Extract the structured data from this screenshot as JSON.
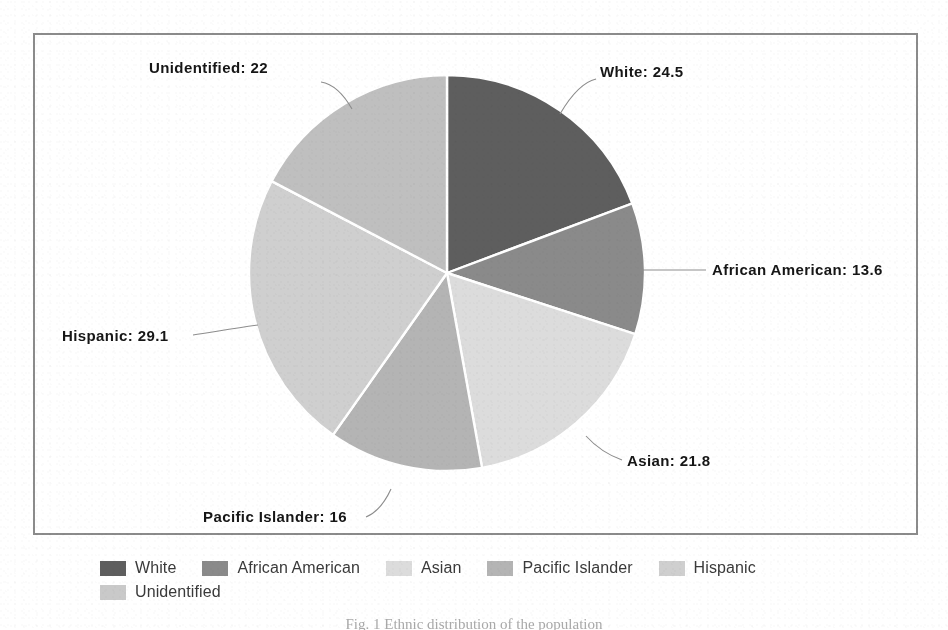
{
  "chart_data": {
    "type": "pie",
    "title": "",
    "categories": [
      "White",
      "African American",
      "Asian",
      "Pacific Islander",
      "Hispanic",
      "Unidentified"
    ],
    "values": [
      24.5,
      13.6,
      21.8,
      16,
      29.1,
      22
    ],
    "total": 127.0,
    "start_angle_deg": 0,
    "direction": "clockwise",
    "labels": [
      "White: 24.5",
      "African American: 13.6",
      "Asian: 21.8",
      "Pacific Islander: 16",
      "Hispanic: 29.1",
      "Unidentified: 22"
    ],
    "slice_colors": [
      "#5e5e5e",
      "#8a8a8a",
      "#dcdcdc",
      "#b4b4b4",
      "#cfcfcf",
      "#bfbfbf"
    ],
    "legend_position": "bottom",
    "grid": false
  },
  "frame": {
    "border_color": "#8b8b8b"
  },
  "pie": {
    "center_x": 447,
    "center_y": 273,
    "radius": 198,
    "separator_color": "#ffffff",
    "slices": [
      {
        "name": "White",
        "label": "White: 24.5",
        "value": 24.5,
        "color": "#5e5e5e"
      },
      {
        "name": "African American",
        "label": "African American: 13.6",
        "value": 13.6,
        "color": "#8a8a8a"
      },
      {
        "name": "Asian",
        "label": "Asian: 21.8",
        "value": 21.8,
        "color": "#dcdcdc"
      },
      {
        "name": "Pacific Islander",
        "label": "Pacific Islander: 16",
        "value": 16,
        "color": "#b4b4b4"
      },
      {
        "name": "Hispanic",
        "label": "Hispanic: 29.1",
        "value": 29.1,
        "color": "#cfcfcf"
      },
      {
        "name": "Unidentified",
        "label": "Unidentified: 22",
        "value": 22,
        "color": "#bfbfbf"
      }
    ]
  },
  "legend": {
    "rows": [
      [
        {
          "label": "White",
          "color": "#5e5e5e"
        },
        {
          "label": "African American",
          "color": "#8a8a8a"
        },
        {
          "label": "Asian",
          "color": "#dcdcdc"
        },
        {
          "label": "Pacific Islander",
          "color": "#b4b4b4"
        },
        {
          "label": "Hispanic",
          "color": "#cfcfcf"
        }
      ],
      [
        {
          "label": "Unidentified",
          "color": "#c9c9c9"
        }
      ]
    ]
  },
  "caption": {
    "text": "Fig. 1   Ethnic distribution of the population"
  }
}
